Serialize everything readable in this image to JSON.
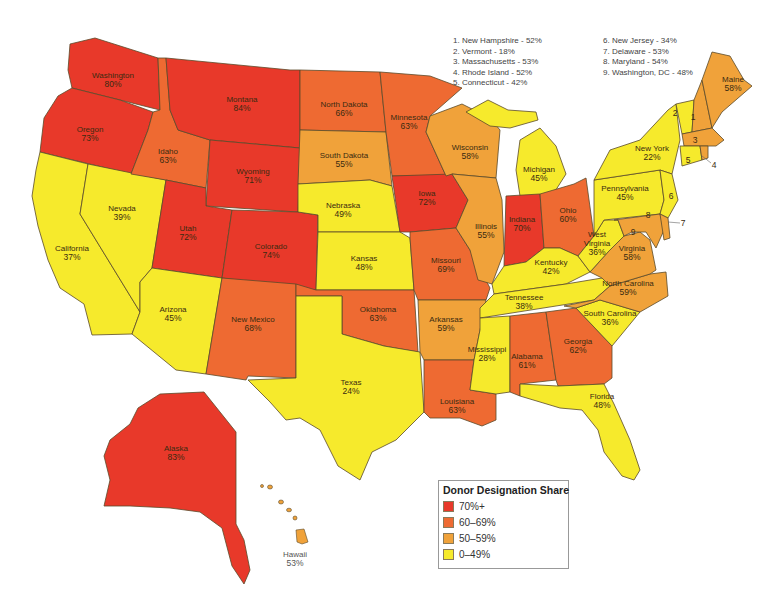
{
  "colors": {
    "c70": "#e8392a",
    "c60": "#ee6a32",
    "c50": "#f0a23a",
    "c0": "#f6ea2c",
    "border": "#5a4a2a"
  },
  "legend": {
    "title": "Donor Designation Share",
    "items": [
      {
        "label": "70%+",
        "color": "#e8392a"
      },
      {
        "label": "60–69%",
        "color": "#ee6a32"
      },
      {
        "label": "50–59%",
        "color": "#f0a23a"
      },
      {
        "label": "0–49%",
        "color": "#f6ea2c"
      }
    ]
  },
  "footnotes": {
    "left": [
      "1. New Hampshire - 52%",
      "2. Vermont - 18%",
      "3. Massachusetts - 53%",
      "4. Rhode Island - 52%",
      "5. Connecticut - 42%"
    ],
    "right": [
      "6. New Jersey - 34%",
      "7. Delaware - 53%",
      "8. Maryland - 54%",
      "9. Washington, DC - 48%"
    ]
  },
  "states": {
    "washington": {
      "name": "Washington",
      "value": "80%"
    },
    "oregon": {
      "name": "Oregon",
      "value": "73%"
    },
    "california": {
      "name": "California",
      "value": "37%"
    },
    "nevada": {
      "name": "Nevada",
      "value": "39%"
    },
    "idaho": {
      "name": "Idaho",
      "value": "63%"
    },
    "montana": {
      "name": "Montana",
      "value": "84%"
    },
    "wyoming": {
      "name": "Wyoming",
      "value": "71%"
    },
    "utah": {
      "name": "Utah",
      "value": "72%"
    },
    "colorado": {
      "name": "Colorado",
      "value": "74%"
    },
    "arizona": {
      "name": "Arizona",
      "value": "45%"
    },
    "new_mexico": {
      "name": "New Mexico",
      "value": "68%"
    },
    "north_dakota": {
      "name": "North Dakota",
      "value": "66%"
    },
    "south_dakota": {
      "name": "South Dakota",
      "value": "55%"
    },
    "nebraska": {
      "name": "Nebraska",
      "value": "49%"
    },
    "kansas": {
      "name": "Kansas",
      "value": "48%"
    },
    "oklahoma": {
      "name": "Oklahoma",
      "value": "63%"
    },
    "texas": {
      "name": "Texas",
      "value": "24%"
    },
    "minnesota": {
      "name": "Minnesota",
      "value": "63%"
    },
    "iowa": {
      "name": "Iowa",
      "value": "72%"
    },
    "missouri": {
      "name": "Missouri",
      "value": "69%"
    },
    "arkansas": {
      "name": "Arkansas",
      "value": "59%"
    },
    "louisiana": {
      "name": "Louisiana",
      "value": "63%"
    },
    "wisconsin": {
      "name": "Wisconsin",
      "value": "58%"
    },
    "illinois": {
      "name": "Illinois",
      "value": "55%"
    },
    "michigan": {
      "name": "Michigan",
      "value": "45%"
    },
    "indiana": {
      "name": "Indiana",
      "value": "70%"
    },
    "ohio": {
      "name": "Ohio",
      "value": "60%"
    },
    "kentucky": {
      "name": "Kentucky",
      "value": "42%"
    },
    "tennessee": {
      "name": "Tennessee",
      "value": "38%"
    },
    "mississippi": {
      "name": "Mississippi",
      "value": "28%"
    },
    "alabama": {
      "name": "Alabama",
      "value": "61%"
    },
    "georgia": {
      "name": "Georgia",
      "value": "62%"
    },
    "florida": {
      "name": "Florida",
      "value": "48%"
    },
    "south_carolina": {
      "name": "South Carolina",
      "value": "36%"
    },
    "north_carolina": {
      "name": "North Carolina",
      "value": "59%"
    },
    "virginia": {
      "name": "Virginia",
      "value": "58%"
    },
    "west_virginia": {
      "name": "West Virginia",
      "value": "36%"
    },
    "pennsylvania": {
      "name": "Pennsylvania",
      "value": "45%"
    },
    "new_york": {
      "name": "New York",
      "value": "22%"
    },
    "maine": {
      "name": "Maine",
      "value": "58%"
    },
    "alaska": {
      "name": "Alaska",
      "value": "83%"
    },
    "hawaii": {
      "name": "Hawaii",
      "value": "53%"
    }
  },
  "small_state_markers": [
    "1",
    "2",
    "3",
    "4",
    "5",
    "6",
    "7",
    "8",
    "9"
  ]
}
